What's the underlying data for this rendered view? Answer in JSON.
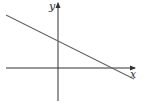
{
  "diagram": {
    "type": "line-graph",
    "axes": {
      "x_label": "x",
      "y_label": "y"
    },
    "line": {
      "description": "straight line with negative slope, positive y-intercept, positive x-intercept"
    },
    "colors": {
      "axis": "#333333",
      "line": "#666666",
      "background": "#ffffff"
    }
  }
}
